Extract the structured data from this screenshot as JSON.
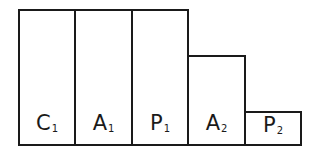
{
  "diagram": {
    "type": "stepped-blocks",
    "blocks": [
      {
        "letter": "C",
        "sub": "1",
        "relative_height": 1.0
      },
      {
        "letter": "A",
        "sub": "1",
        "relative_height": 1.0
      },
      {
        "letter": "P",
        "sub": "1",
        "relative_height": 1.0
      },
      {
        "letter": "A",
        "sub": "2",
        "relative_height": 0.65
      },
      {
        "letter": "P",
        "sub": "2",
        "relative_height": 0.24
      }
    ],
    "stroke_color": "#1a1a1a",
    "fill_color": "#ffffff"
  }
}
